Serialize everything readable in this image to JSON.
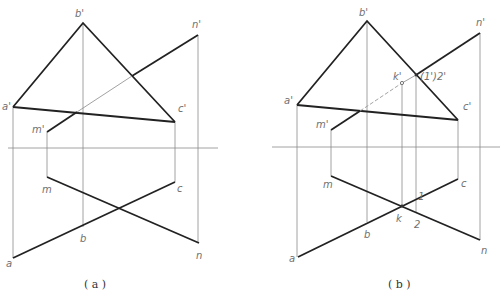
{
  "figure": {
    "panels": [
      {
        "id": "a",
        "caption": "( a )",
        "labels": {
          "a_prime": "a'",
          "b_prime": "b'",
          "c_prime": "c'",
          "m_prime": "m'",
          "n_prime": "n'",
          "a": "a",
          "b": "b",
          "c": "c",
          "m": "m",
          "n": "n"
        }
      },
      {
        "id": "b",
        "caption": "( b )",
        "labels": {
          "a_prime": "a'",
          "b_prime": "b'",
          "c_prime": "c'",
          "m_prime": "m'",
          "n_prime": "n'",
          "k_prime": "k'",
          "one_two_prime": "(1')2'",
          "a": "a",
          "b": "b",
          "c": "c",
          "m": "m",
          "n": "n",
          "k": "k",
          "one": "1",
          "two": "2"
        }
      }
    ],
    "colors": {
      "thick_line": "#222222",
      "thin_line": "#8a8a8a",
      "label": "#707070"
    }
  }
}
